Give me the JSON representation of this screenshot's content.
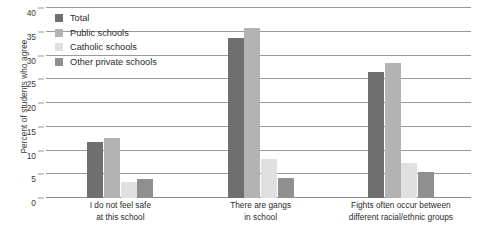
{
  "chart_data": {
    "type": "bar",
    "title": "",
    "xlabel": "",
    "ylabel": "Percent of students who agree",
    "ylim": [
      0,
      40
    ],
    "yticks": [
      0,
      5,
      10,
      15,
      20,
      25,
      30,
      35,
      40
    ],
    "ytick_labels": [
      "0",
      "5",
      "10",
      "15",
      "20",
      "25",
      "30",
      "35",
      "40"
    ],
    "grid": true,
    "legend_position": "upper-left-inside",
    "categories": [
      "I do not feel safe at this school",
      "There are gangs in school",
      "Fights often occur between different racial/ethnic groups"
    ],
    "category_lines": [
      [
        "I do not feel safe",
        "at this school"
      ],
      [
        "There are gangs",
        "in school"
      ],
      [
        "Fights often occur between",
        "different racial/ethnic groups"
      ]
    ],
    "series": [
      {
        "name": "Total",
        "color": "#6f6f6f",
        "values": [
          11.8,
          33.7,
          26.6
        ]
      },
      {
        "name": "Public schools",
        "color": "#b3b3b3",
        "values": [
          12.6,
          35.8,
          28.4
        ]
      },
      {
        "name": "Catholic schools",
        "color": "#e0e0e0",
        "values": [
          3.4,
          8.2,
          7.4
        ]
      },
      {
        "name": "Other private schools",
        "color": "#8f8f8f",
        "values": [
          4.0,
          4.3,
          5.4
        ]
      }
    ]
  }
}
